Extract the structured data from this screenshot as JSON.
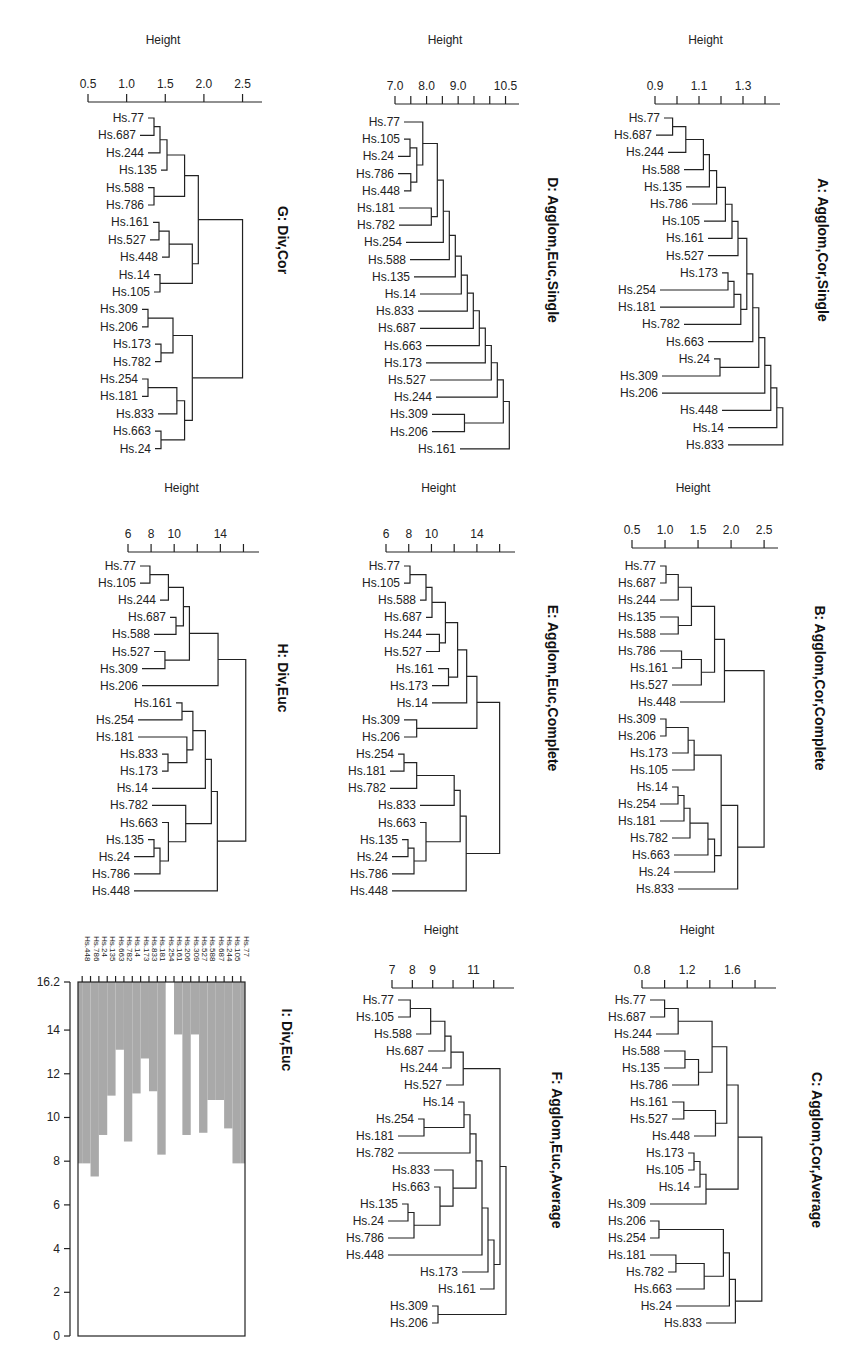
{
  "figure": {
    "axis_title": "Height"
  },
  "chart_data": [
    {
      "id": "G",
      "type": "dendrogram",
      "title": "G: Div,Cor",
      "xlabel": "Height",
      "ticks": [
        0.5,
        1.0,
        1.5,
        2.0,
        2.5
      ],
      "tick_labels": [
        "0.5",
        "1.0",
        "1.5",
        "2.0",
        "2.5"
      ],
      "xlim": [
        0.5,
        2.7
      ],
      "leaves": [
        "Hs.77",
        "Hs.687",
        "Hs.244",
        "Hs.135",
        "Hs.588",
        "Hs.786",
        "Hs.161",
        "Hs.527",
        "Hs.448",
        "Hs.14",
        "Hs.105",
        "Hs.309",
        "Hs.206",
        "Hs.173",
        "Hs.782",
        "Hs.254",
        "Hs.181",
        "Hs.833",
        "Hs.663",
        "Hs.24"
      ],
      "tree": [
        [
          [
            [
              [
                [
                  "Hs.77",
                  "Hs.687",
                  1.0
                ],
                "Hs.244",
                1.2
              ],
              "Hs.135",
              1.4
            ],
            [
              [
                "Hs.588",
                "Hs.786",
                1.2
              ],
              null,
              0
            ],
            1.75
          ],
          [
            [
              [
                [
                  "Hs.161",
                  "Hs.527",
                  1.25
                ],
                "Hs.448",
                1.55
              ],
              [
                "Hs.14",
                "Hs.105",
                1.35
              ],
              1.85
            ],
            null,
            0
          ],
          1.9
        ],
        [
          [
            [
              [
                "Hs.309",
                "Hs.206",
                1.0
              ],
              [
                "Hs.173",
                "Hs.782",
                1.35
              ],
              1.6
            ],
            [
              [
                [
                  "Hs.254",
                  "Hs.181",
                  1.05
                ],
                "Hs.833",
                1.65
              ],
              [
                "Hs.663",
                "Hs.24",
                1.35
              ],
              1.75
            ],
            1.85
          ],
          null,
          0
        ],
        2.5
      ]
    },
    {
      "id": "D",
      "type": "dendrogram",
      "title": "D: Agglom,Euc,Single",
      "xlabel": "Height",
      "ticks": [
        7.0,
        8.0,
        9.0,
        10.5
      ],
      "tick_labels": [
        "7.0",
        "8.0",
        "9.0",
        "10.5"
      ],
      "minor_ticks": [
        7.0,
        7.5,
        8.0,
        8.5,
        9.0,
        9.5,
        10.0,
        10.5
      ],
      "xlim": [
        7.0,
        10.8
      ],
      "leaves": [
        "Hs.77",
        "Hs.105",
        "Hs.24",
        "Hs.786",
        "Hs.448",
        "Hs.181",
        "Hs.782",
        "Hs.254",
        "Hs.588",
        "Hs.135",
        "Hs.14",
        "Hs.833",
        "Hs.687",
        "Hs.663",
        "Hs.173",
        "Hs.527",
        "Hs.244",
        "Hs.309",
        "Hs.206",
        "Hs.161"
      ],
      "merge_heights": [
        7.8,
        7.3,
        7.6,
        7.5,
        8.2,
        8.15,
        8.2,
        8.4,
        8.4,
        8.9,
        8.9,
        8.9,
        9.0,
        9.0,
        9.4,
        9.4,
        9.6,
        9.2,
        10.4
      ]
    },
    {
      "id": "A",
      "type": "dendrogram",
      "title": "A: Agglom,Cor,Single",
      "xlabel": "Height",
      "ticks": [
        0.9,
        1.1,
        1.3
      ],
      "tick_labels": [
        "0.9",
        "1.1",
        "1.3"
      ],
      "minor_ticks": [
        0.9,
        1.0,
        1.1,
        1.2,
        1.3,
        1.4
      ],
      "xlim": [
        0.9,
        1.45
      ],
      "leaves": [
        "Hs.77",
        "Hs.687",
        "Hs.244",
        "Hs.588",
        "Hs.135",
        "Hs.786",
        "Hs.105",
        "Hs.161",
        "Hs.527",
        "Hs.173",
        "Hs.254",
        "Hs.181",
        "Hs.782",
        "Hs.663",
        "Hs.24",
        "Hs.309",
        "Hs.206",
        "Hs.448",
        "Hs.14",
        "Hs.833"
      ],
      "merge_heights": [
        0.98,
        1.04,
        1.12,
        1.13,
        1.18,
        1.22,
        1.25,
        1.25,
        1.3,
        0.93,
        1.11,
        1.29,
        1.31,
        1.31,
        0.97,
        1.32,
        1.33,
        1.35,
        1.38
      ]
    },
    {
      "id": "H",
      "type": "dendrogram",
      "title": "H: Div,Euc",
      "xlabel": "Height",
      "ticks": [
        6,
        8,
        10,
        14
      ],
      "tick_labels": [
        "6",
        "8",
        "10",
        "14"
      ],
      "minor_ticks": [
        6,
        8,
        10,
        12,
        14,
        16
      ],
      "xlim": [
        6,
        17
      ],
      "leaves": [
        "Hs.77",
        "Hs.105",
        "Hs.244",
        "Hs.687",
        "Hs.588",
        "Hs.527",
        "Hs.309",
        "Hs.206",
        "Hs.161",
        "Hs.254",
        "Hs.181",
        "Hs.833",
        "Hs.173",
        "Hs.14",
        "Hs.782",
        "Hs.663",
        "Hs.135",
        "Hs.24",
        "Hs.786",
        "Hs.448"
      ],
      "merge_heights": [
        7.9,
        9.5,
        10.8,
        9.3,
        11.0,
        9.2,
        13.8,
        16.2,
        8.3,
        11.2,
        11.1,
        8.9,
        12.7,
        13.0,
        11.0,
        9.5,
        7.3,
        7.9,
        13.1
      ]
    },
    {
      "id": "E",
      "type": "dendrogram",
      "title": "E: Agglom,Euc,Complete",
      "xlabel": "Height",
      "ticks": [
        6,
        8,
        10,
        14
      ],
      "tick_labels": [
        "6",
        "8",
        "10",
        "14"
      ],
      "minor_ticks": [
        6,
        8,
        10,
        12,
        14,
        16
      ],
      "xlim": [
        6,
        17
      ],
      "leaves": [
        "Hs.77",
        "Hs.105",
        "Hs.588",
        "Hs.687",
        "Hs.244",
        "Hs.527",
        "Hs.161",
        "Hs.173",
        "Hs.14",
        "Hs.309",
        "Hs.206",
        "Hs.254",
        "Hs.181",
        "Hs.782",
        "Hs.833",
        "Hs.663",
        "Hs.135",
        "Hs.24",
        "Hs.786",
        "Hs.448"
      ],
      "merge_heights": [
        8.0,
        9.0,
        10.0,
        10.8,
        10.7,
        12.3,
        11.5,
        13.1,
        14.0,
        8.7,
        16.0,
        7.5,
        8.7,
        12.0,
        12.0,
        9.0,
        7.3,
        8.0,
        12.0
      ]
    },
    {
      "id": "B",
      "type": "dendrogram",
      "title": "B: Agglom,Cor,Complete",
      "xlabel": "Height",
      "ticks": [
        0.5,
        1.0,
        1.5,
        2.0,
        2.5
      ],
      "tick_labels": [
        "0.5",
        "1.0",
        "1.5",
        "2.0",
        "2.5"
      ],
      "xlim": [
        0.5,
        2.65
      ],
      "leaves": [
        "Hs.77",
        "Hs.687",
        "Hs.244",
        "Hs.135",
        "Hs.588",
        "Hs.786",
        "Hs.161",
        "Hs.527",
        "Hs.448",
        "Hs.309",
        "Hs.206",
        "Hs.173",
        "Hs.105",
        "Hs.14",
        "Hs.254",
        "Hs.181",
        "Hs.782",
        "Hs.663",
        "Hs.24",
        "Hs.833"
      ],
      "merge_heights": [
        1.0,
        1.2,
        1.4,
        1.2,
        1.75,
        1.25,
        1.55,
        1.9,
        2.5,
        0.95,
        1.35,
        1.35,
        1.85,
        0.95,
        1.25,
        1.3,
        1.65,
        1.75,
        2.1
      ]
    },
    {
      "id": "I",
      "type": "banner",
      "title": "I: Div,Euc",
      "yticks": [
        0,
        2,
        4,
        6,
        8,
        10,
        12,
        14,
        16.2
      ],
      "ytick_labels": [
        "0",
        "2",
        "4",
        "6",
        "8",
        "10",
        "12",
        "14",
        "16.2"
      ],
      "ylim": [
        0,
        16.2
      ],
      "leaves": [
        "Hs.448",
        "Hs.786",
        "Hs.24",
        "Hs.135",
        "Hs.663",
        "Hs.782",
        "Hs.14",
        "Hs.173",
        "Hs.833",
        "Hs.181",
        "Hs.254",
        "Hs.161",
        "Hs.206",
        "Hs.309",
        "Hs.527",
        "Hs.588",
        "Hs.687",
        "Hs.244",
        "Hs.105",
        "Hs.77"
      ],
      "heights": [
        7.9,
        7.3,
        9.2,
        11.0,
        13.1,
        8.9,
        11.1,
        12.7,
        11.2,
        8.3,
        16.2,
        13.8,
        9.2,
        13.8,
        9.3,
        10.8,
        10.8,
        9.5,
        7.9
      ]
    },
    {
      "id": "F",
      "type": "dendrogram",
      "title": "F: Agglom,Euc,Average",
      "xlabel": "Height",
      "ticks": [
        7,
        8,
        9,
        11
      ],
      "tick_labels": [
        "7",
        "8",
        "9",
        "11"
      ],
      "minor_ticks": [
        7,
        8,
        9,
        10,
        11,
        12
      ],
      "xlim": [
        7,
        12.8
      ],
      "leaves": [
        "Hs.77",
        "Hs.105",
        "Hs.588",
        "Hs.687",
        "Hs.244",
        "Hs.527",
        "Hs.14",
        "Hs.254",
        "Hs.181",
        "Hs.782",
        "Hs.833",
        "Hs.663",
        "Hs.135",
        "Hs.24",
        "Hs.786",
        "Hs.448",
        "Hs.173",
        "Hs.161",
        "Hs.309",
        "Hs.206"
      ],
      "merge_heights": [
        7.9,
        8.9,
        9.6,
        9.9,
        10.5,
        11.4,
        8.5,
        7.5,
        9.9,
        10.1,
        10.0,
        9.0,
        7.5,
        8.0,
        10.1,
        10.6,
        11.0,
        12.0,
        8.2
      ]
    },
    {
      "id": "C",
      "type": "dendrogram",
      "title": "C: Agglom,Cor,Average",
      "xlabel": "Height",
      "ticks": [
        0.8,
        1.2,
        1.6
      ],
      "tick_labels": [
        "0.8",
        "1.2",
        "1.6"
      ],
      "minor_ticks": [
        0.8,
        1.0,
        1.2,
        1.4,
        1.6,
        1.8
      ],
      "xlim": [
        0.8,
        1.95
      ],
      "leaves": [
        "Hs.77",
        "Hs.687",
        "Hs.244",
        "Hs.588",
        "Hs.135",
        "Hs.786",
        "Hs.161",
        "Hs.527",
        "Hs.448",
        "Hs.173",
        "Hs.105",
        "Hs.14",
        "Hs.309",
        "Hs.206",
        "Hs.254",
        "Hs.181",
        "Hs.782",
        "Hs.663",
        "Hs.24",
        "Hs.833"
      ],
      "merge_heights": [
        1.0,
        1.12,
        1.42,
        1.18,
        1.3,
        1.55,
        1.17,
        1.45,
        1.65,
        1.1,
        1.15,
        1.15,
        1.86,
        0.95,
        1.52,
        1.1,
        1.35,
        1.55,
        1.6
      ]
    }
  ]
}
